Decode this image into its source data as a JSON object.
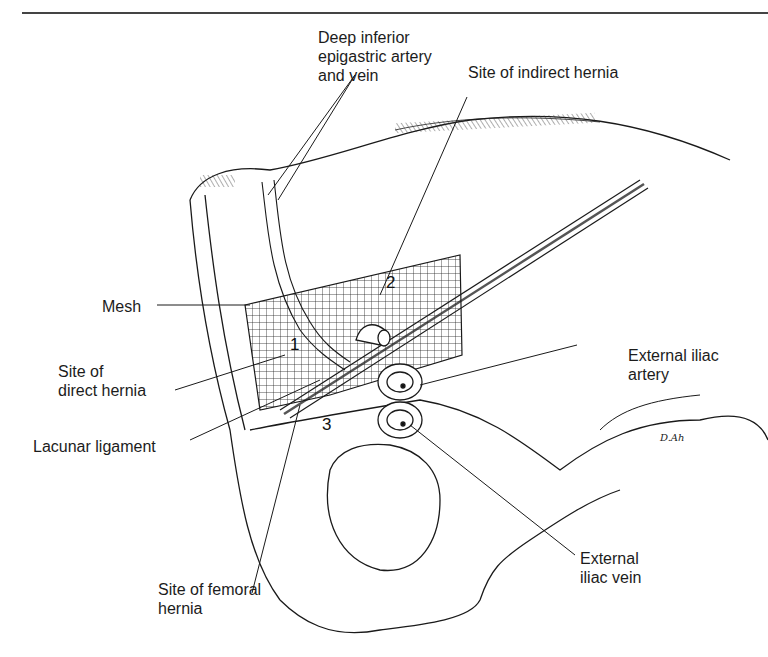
{
  "figure": {
    "signature": "D.Ah",
    "colors": {
      "line": "#1a1a1a",
      "background": "#ffffff",
      "rule": "#444444"
    },
    "region_numbers": [
      "1",
      "2",
      "3"
    ],
    "labels": [
      {
        "id": "deep-inferior-epigastric",
        "lines": [
          "Deep inferior",
          "epigastric artery",
          "and vein"
        ]
      },
      {
        "id": "site-of-indirect-hernia",
        "lines": [
          "Site of indirect hernia"
        ]
      },
      {
        "id": "mesh",
        "lines": [
          "Mesh"
        ]
      },
      {
        "id": "site-of-direct-hernia",
        "lines": [
          "Site of",
          "direct hernia"
        ]
      },
      {
        "id": "external-iliac-artery",
        "lines": [
          "External iliac",
          "artery"
        ]
      },
      {
        "id": "lacunar-ligament",
        "lines": [
          "Lacunar ligament"
        ]
      },
      {
        "id": "site-of-femoral-hernia",
        "lines": [
          "Site of femoral",
          "hernia"
        ]
      },
      {
        "id": "external-iliac-vein",
        "lines": [
          "External",
          "iliac vein"
        ]
      }
    ]
  }
}
